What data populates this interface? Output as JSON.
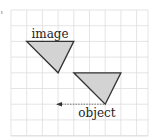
{
  "diagram": {
    "type": "reflection-grid",
    "grid": {
      "x0": 11,
      "y0": 10,
      "cell": 15.7,
      "cols": 8,
      "rows": 8,
      "right_edge": 148,
      "bottom_edge": 136,
      "line_color": "#dddddd"
    },
    "colors": {
      "triangle_fill": "#d3d3d3",
      "triangle_stroke": "#333333",
      "arrow": "#555555",
      "text": "#222222"
    },
    "shapes": [
      {
        "name": "image",
        "label": "image",
        "points": [
          [
            26.7,
            41.4
          ],
          [
            73.8,
            41.4
          ],
          [
            58.1,
            72.8
          ]
        ]
      },
      {
        "name": "object",
        "label": "object",
        "points": [
          [
            73.8,
            72.8
          ],
          [
            120.9,
            72.8
          ],
          [
            105.2,
            104.2
          ]
        ]
      }
    ],
    "arrow": {
      "from": [
        104,
        104.2
      ],
      "to": [
        56,
        104.2
      ],
      "style": "dashed"
    },
    "labels": {
      "image": "image",
      "object": "object"
    }
  }
}
